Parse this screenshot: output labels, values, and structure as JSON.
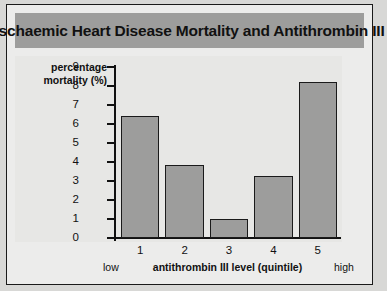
{
  "chart_data": {
    "type": "bar",
    "title": "Ischaemic Heart Disease Mortality and Antithrombin III",
    "xlabel": "antithrombin III level (quintile)",
    "ylabel": "percentage mortality (%)",
    "ylabel_line1": "percentage",
    "ylabel_line2": "mortality (%)",
    "categories": [
      "1",
      "2",
      "3",
      "4",
      "5"
    ],
    "values": [
      6.4,
      3.85,
      0.98,
      3.25,
      8.2
    ],
    "ylim": [
      0,
      9
    ],
    "yticks": [
      0,
      1,
      2,
      3,
      4,
      5,
      6,
      7,
      8,
      9
    ],
    "ytick_labels": [
      "0",
      "1",
      "2",
      "3",
      "4",
      "5",
      "6",
      "7",
      "8",
      "9"
    ],
    "grid": false,
    "legend": null,
    "axis_annotations": {
      "low": "low",
      "high": "high"
    },
    "bar_color": "#9d9d9c",
    "bar_edge_color": "#1a1a1a",
    "plot_background": "#e7e7e5",
    "title_band_color": "#9d9d9c",
    "figure_background": "#ececeb"
  }
}
